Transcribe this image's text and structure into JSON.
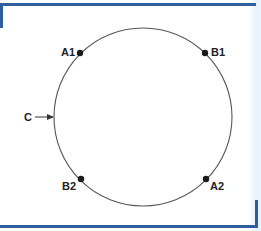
{
  "diagram": {
    "type": "circle-with-points",
    "circle": {
      "label": "C",
      "cx": 143,
      "cy": 117,
      "r": 89,
      "stroke": "#555555"
    },
    "points": [
      {
        "id": "A1",
        "label": "A1",
        "x": 80,
        "y": 53
      },
      {
        "id": "B1",
        "label": "B1",
        "x": 205,
        "y": 53
      },
      {
        "id": "B2",
        "label": "B2",
        "x": 81,
        "y": 179
      },
      {
        "id": "A2",
        "label": "A2",
        "x": 206,
        "y": 179
      }
    ],
    "pointer": {
      "label": "C",
      "target": "circle"
    },
    "colors": {
      "frame": "#2f5f9e",
      "edge_tint": "#e6f2fb",
      "stroke": "#555555",
      "point": "#1a1a1a",
      "text": "#222222"
    }
  }
}
